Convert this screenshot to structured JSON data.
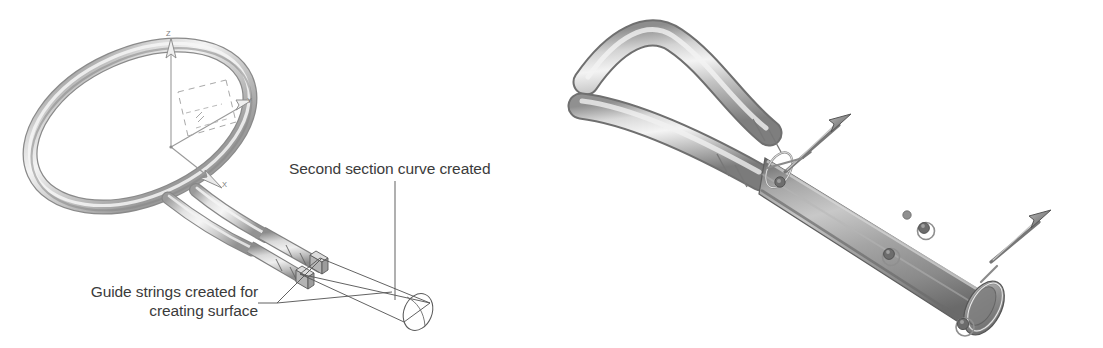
{
  "figure": {
    "type": "cad-illustration",
    "panels": [
      {
        "id": "left",
        "name": "racket-wireframe-view",
        "description": "Shaded tennis racket frame with coordinate triad and annotation callouts"
      },
      {
        "id": "right",
        "name": "handle-sweep-render",
        "description": "Shaded close-up render of the racket handle swept surface with section curve rings and direction arrows"
      }
    ]
  },
  "annotations": {
    "second_section": {
      "label": "Second section curve created"
    },
    "guide_strings": {
      "label": "Guide strings created for creating surface",
      "line1": "Guide strings created for",
      "line2": "creating surface"
    }
  },
  "axes": {
    "z": "Z",
    "y": "Y",
    "x": "X"
  },
  "colors": {
    "background": "#ffffff",
    "text": "#3b3b3b",
    "line": "#5a5a5a",
    "axis_text": "#7a7a7a",
    "tube_light": "#f2f2f2",
    "tube_mid": "#c9c9c9",
    "tube_dark": "#8e8e8e",
    "cylinder_mid": "#9d9d9d",
    "cylinder_dark": "#6e6e6e",
    "handle_ring": "#777777"
  }
}
